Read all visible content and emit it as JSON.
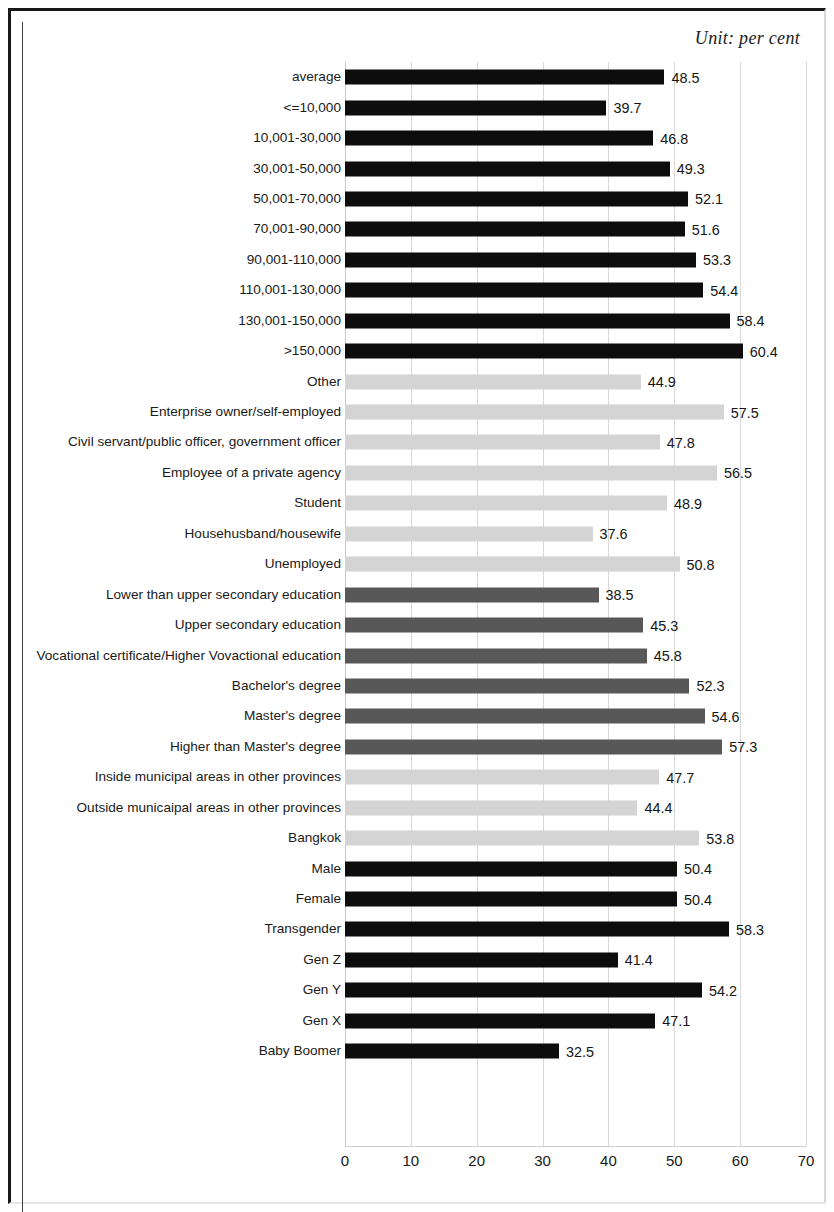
{
  "figure": {
    "unit_note": "Unit:  per cent"
  },
  "chart_data": {
    "type": "bar",
    "orientation": "horizontal",
    "title": "",
    "subtitle": "",
    "annotations": [
      "Unit:  per cent"
    ],
    "xlabel": "",
    "ylabel": "",
    "xlim": [
      0,
      70
    ],
    "xticks": [
      0,
      10,
      20,
      30,
      40,
      50,
      60,
      70
    ],
    "xtick_labels": [
      "0",
      "10",
      "20",
      "30",
      "40",
      "50",
      "60",
      "70"
    ],
    "grid": true,
    "grid_axis": "x",
    "legend": "none",
    "value_label_format": "one-decimal",
    "colors": {
      "income": "#0d0d0d",
      "occupation": "#d4d4d4",
      "education": "#585858",
      "region": "#d4d4d4",
      "gender": "#0d0d0d",
      "generation": "#0d0d0d"
    },
    "categories": [
      "average",
      "<=10,000",
      "10,001-30,000",
      "30,001-50,000",
      "50,001-70,000",
      "70,001-90,000",
      "90,001-110,000",
      "110,001-130,000",
      "130,001-150,000",
      ">150,000",
      "Other",
      "Enterprise owner/self-employed",
      "Civil servant/public officer, government officer",
      "Employee of a private agency",
      "Student",
      "Househusband/housewife",
      "Unemployed",
      "Lower than upper secondary education",
      "Upper secondary education",
      "Vocational certificate/Higher Vovactional education",
      "Bachelor's degree",
      "Master's degree",
      "Higher than Master's degree",
      "Inside municipal areas in other provinces",
      "Outside municaipal areas in other provinces",
      "Bangkok",
      "Male",
      "Female",
      "Transgender",
      "Gen Z",
      "Gen Y",
      "Gen X",
      "Baby Boomer"
    ],
    "values": [
      48.5,
      39.7,
      46.8,
      49.3,
      52.1,
      51.6,
      53.3,
      54.4,
      58.4,
      60.4,
      44.9,
      57.5,
      47.8,
      56.5,
      48.9,
      37.6,
      50.8,
      38.5,
      45.3,
      45.8,
      52.3,
      54.6,
      57.3,
      47.7,
      44.4,
      53.8,
      50.4,
      50.4,
      58.3,
      41.4,
      54.2,
      47.1,
      32.5
    ],
    "value_labels": [
      "48.5",
      "39.7",
      "46.8",
      "49.3",
      "52.1",
      "51.6",
      "53.3",
      "54.4",
      "58.4",
      "60.4",
      "44.9",
      "57.5",
      "47.8",
      "56.5",
      "48.9",
      "37.6",
      "50.8",
      "38.5",
      "45.3",
      "45.8",
      "52.3",
      "54.6",
      "57.3",
      "47.7",
      "44.4",
      "53.8",
      "50.4",
      "50.4",
      "58.3",
      "41.4",
      "54.2",
      "47.1",
      "32.5"
    ],
    "groups": [
      "income",
      "income",
      "income",
      "income",
      "income",
      "income",
      "income",
      "income",
      "income",
      "income",
      "occupation",
      "occupation",
      "occupation",
      "occupation",
      "occupation",
      "occupation",
      "occupation",
      "education",
      "education",
      "education",
      "education",
      "education",
      "education",
      "region",
      "region",
      "region",
      "gender",
      "gender",
      "gender",
      "generation",
      "generation",
      "generation",
      "generation"
    ]
  }
}
